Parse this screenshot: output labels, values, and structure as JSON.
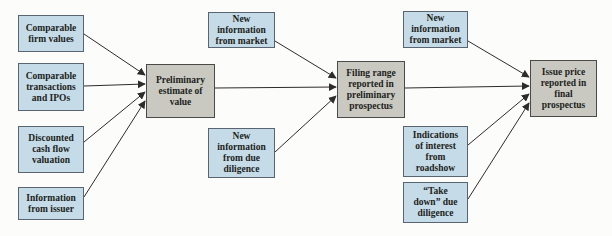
{
  "figure": {
    "colors": {
      "input_box_fill": "#c5dbe8",
      "input_box_border": "#586470",
      "stage_box_fill": "#c9c9c2",
      "stage_box_border": "#4a4a48",
      "arrow": "#2e2c2a",
      "text": "#211e1a",
      "background": "#fcfcfa"
    },
    "nodes": {
      "comparable_firm_values": {
        "label": "Comparable\nfirm values"
      },
      "comparable_transactions": {
        "label": "Comparable\ntransactions\nand IPOs"
      },
      "discounted_cash_flow": {
        "label": "Discounted\ncash flow\nvaluation"
      },
      "information_from_issuer": {
        "label": "Information\nfrom issuer"
      },
      "preliminary_estimate": {
        "label": "Preliminary\nestimate of\nvalue"
      },
      "new_info_market_1": {
        "label": "New\ninformation\nfrom market"
      },
      "new_info_due_diligence": {
        "label": "New\ninformation\nfrom due\ndiligence"
      },
      "filing_range": {
        "label": "Filing range\nreported in\npreliminary\nprospectus"
      },
      "new_info_market_2": {
        "label": "New\ninformation\nfrom market"
      },
      "indications_of_interest": {
        "label": "Indications\nof interest\nfrom\nroadshow"
      },
      "take_down_due_diligence": {
        "label": "“Take\ndown” due\ndiligence"
      },
      "issue_price": {
        "label": "Issue price\nreported in\nfinal\nprospectus"
      }
    },
    "edges": [
      {
        "from": "comparable_firm_values",
        "to": "preliminary_estimate"
      },
      {
        "from": "comparable_transactions",
        "to": "preliminary_estimate"
      },
      {
        "from": "discounted_cash_flow",
        "to": "preliminary_estimate"
      },
      {
        "from": "information_from_issuer",
        "to": "preliminary_estimate"
      },
      {
        "from": "new_info_market_1",
        "to": "filing_range"
      },
      {
        "from": "preliminary_estimate",
        "to": "filing_range"
      },
      {
        "from": "new_info_due_diligence",
        "to": "filing_range"
      },
      {
        "from": "new_info_market_2",
        "to": "issue_price"
      },
      {
        "from": "filing_range",
        "to": "issue_price"
      },
      {
        "from": "indications_of_interest",
        "to": "issue_price"
      },
      {
        "from": "take_down_due_diligence",
        "to": "issue_price"
      }
    ]
  }
}
